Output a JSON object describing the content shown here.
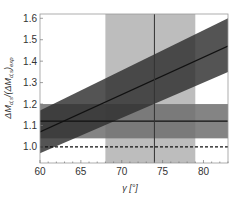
{
  "chart_data": {
    "type": "line",
    "title": "",
    "xlabel": "γ [°]",
    "ylabel": "ΔM_{d,s}/(ΔM_{d,s})_exp",
    "xlim": [
      60,
      83
    ],
    "ylim": [
      0.925,
      1.62
    ],
    "xticks": [
      60,
      65,
      70,
      75,
      80
    ],
    "yticks": [
      1.0,
      1.1,
      1.2,
      1.3,
      1.4,
      1.5,
      1.6
    ],
    "grid": false,
    "legend": null,
    "series": [
      {
        "name": "SM prediction (central)",
        "style": "solid line",
        "color": "#111111",
        "x": [
          60,
          83
        ],
        "y": [
          1.07,
          1.47
        ]
      },
      {
        "name": "SM prediction band",
        "style": "filled band",
        "color": "#3a3a3a",
        "x": [
          60,
          83
        ],
        "y_low": [
          0.97,
          1.35
        ],
        "y_high": [
          1.17,
          1.6
        ]
      },
      {
        "name": "Experimental ratio (central)",
        "style": "horizontal solid line",
        "color": "#111111",
        "y": 1.12
      },
      {
        "name": "Experimental ratio band",
        "style": "horizontal filled band",
        "color": "#6e6e6e",
        "y_low": 1.04,
        "y_high": 1.2
      },
      {
        "name": "Reference ratio = 1",
        "style": "dashed line",
        "color": "#111111",
        "y": 1.0
      },
      {
        "name": "γ measurement (central)",
        "style": "vertical solid line",
        "color": "#333333",
        "x": 74
      },
      {
        "name": "γ measurement band",
        "style": "vertical filled band",
        "color": "#bdbdbd",
        "x_low": 68,
        "x_high": 79
      }
    ]
  },
  "labels": {
    "xlabel": "γ [°]",
    "ylabel_main": "ΔM",
    "ylabel_sub1": "d,s",
    "ylabel_mid": "/(ΔM",
    "ylabel_sub2": "d,s",
    "ylabel_end": ")",
    "ylabel_sub3": "exp",
    "xticks": [
      "60",
      "65",
      "70",
      "75",
      "80"
    ],
    "yticks": [
      "1.0",
      "1.1",
      "1.2",
      "1.3",
      "1.4",
      "1.5",
      "1.6"
    ]
  }
}
